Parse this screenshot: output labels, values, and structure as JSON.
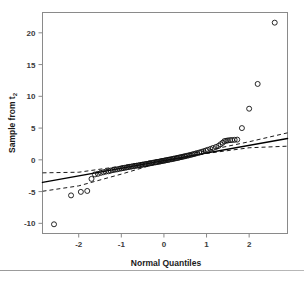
{
  "figure": {
    "name": "normal-qq-plot",
    "background_color": "#ffffff",
    "frame_color": "#8a8a8a",
    "point_color": "#111111",
    "line_color": "#000000",
    "band_color": "#1a1a1a"
  },
  "chart_data": {
    "type": "scatter",
    "title": "",
    "xlabel": "Normal Quantiles",
    "ylabel": "Sample from t",
    "ylabel_subscript": "2",
    "xlim": [
      -2.85,
      2.9
    ],
    "ylim": [
      -11.6,
      23.2
    ],
    "xticks": [
      -2,
      -1,
      0,
      1,
      2
    ],
    "xticklabels": [
      "-2",
      "-1",
      "0",
      "1",
      "2"
    ],
    "yticks": [
      -10,
      -5,
      0,
      5,
      10,
      15,
      20
    ],
    "yticklabels": [
      "-10",
      "-5",
      "0",
      "5",
      "10",
      "15",
      "20"
    ],
    "grid": false,
    "legend": null,
    "fit_line": {
      "label": "least-squares reference line",
      "x": [
        -2.85,
        2.9
      ],
      "y": [
        -3.55,
        3.35
      ]
    },
    "confidence_band_upper": {
      "label": "upper confidence band",
      "x": [
        -2.85,
        -2.0,
        -1.0,
        0.0,
        1.0,
        2.0,
        2.9
      ],
      "y": [
        -2.05,
        -1.95,
        -1.0,
        0.2,
        1.45,
        2.85,
        4.25
      ]
    },
    "confidence_band_lower": {
      "label": "lower confidence band",
      "x": [
        -2.85,
        -2.0,
        -1.0,
        0.0,
        1.0,
        2.0,
        2.9
      ],
      "y": [
        -4.95,
        -4.1,
        -2.25,
        -0.25,
        1.0,
        1.9,
        2.15
      ]
    },
    "series": [
      {
        "name": "sample quantiles",
        "marker": "open-circle",
        "points": [
          [
            -2.58,
            -10.15
          ],
          [
            -2.18,
            -5.6
          ],
          [
            -1.95,
            -5.05
          ],
          [
            -1.8,
            -4.9
          ],
          [
            -1.7,
            -3.0
          ],
          [
            -1.62,
            -2.3
          ],
          [
            -1.55,
            -2.2
          ],
          [
            -1.48,
            -2.05
          ],
          [
            -1.42,
            -1.95
          ],
          [
            -1.36,
            -1.85
          ],
          [
            -1.3,
            -1.8
          ],
          [
            -1.25,
            -1.7
          ],
          [
            -1.2,
            -1.62
          ],
          [
            -1.15,
            -1.55
          ],
          [
            -1.1,
            -1.5
          ],
          [
            -1.05,
            -1.42
          ],
          [
            -1.0,
            -1.36
          ],
          [
            -0.96,
            -1.3
          ],
          [
            -0.92,
            -1.25
          ],
          [
            -0.88,
            -1.2
          ],
          [
            -0.84,
            -1.14
          ],
          [
            -0.8,
            -1.1
          ],
          [
            -0.76,
            -1.05
          ],
          [
            -0.72,
            -1.0
          ],
          [
            -0.68,
            -0.96
          ],
          [
            -0.64,
            -0.92
          ],
          [
            -0.6,
            -0.88
          ],
          [
            -0.57,
            -0.84
          ],
          [
            -0.53,
            -0.8
          ],
          [
            -0.5,
            -0.76
          ],
          [
            -0.46,
            -0.72
          ],
          [
            -0.43,
            -0.68
          ],
          [
            -0.4,
            -0.64
          ],
          [
            -0.36,
            -0.6
          ],
          [
            -0.33,
            -0.56
          ],
          [
            -0.3,
            -0.52
          ],
          [
            -0.27,
            -0.48
          ],
          [
            -0.24,
            -0.44
          ],
          [
            -0.2,
            -0.4
          ],
          [
            -0.17,
            -0.36
          ],
          [
            -0.14,
            -0.32
          ],
          [
            -0.11,
            -0.28
          ],
          [
            -0.08,
            -0.24
          ],
          [
            -0.05,
            -0.2
          ],
          [
            -0.02,
            -0.16
          ],
          [
            0.01,
            -0.12
          ],
          [
            0.04,
            -0.08
          ],
          [
            0.07,
            -0.04
          ],
          [
            0.1,
            0.0
          ],
          [
            0.13,
            0.04
          ],
          [
            0.17,
            0.09
          ],
          [
            0.2,
            0.13
          ],
          [
            0.23,
            0.18
          ],
          [
            0.26,
            0.22
          ],
          [
            0.3,
            0.27
          ],
          [
            0.33,
            0.32
          ],
          [
            0.36,
            0.37
          ],
          [
            0.4,
            0.42
          ],
          [
            0.43,
            0.47
          ],
          [
            0.47,
            0.53
          ],
          [
            0.5,
            0.58
          ],
          [
            0.54,
            0.64
          ],
          [
            0.58,
            0.7
          ],
          [
            0.62,
            0.77
          ],
          [
            0.66,
            0.84
          ],
          [
            0.7,
            0.91
          ],
          [
            0.74,
            0.98
          ],
          [
            0.78,
            1.06
          ],
          [
            0.83,
            1.15
          ],
          [
            0.88,
            1.25
          ],
          [
            0.93,
            1.35
          ],
          [
            0.98,
            1.46
          ],
          [
            1.03,
            1.58
          ],
          [
            1.09,
            1.72
          ],
          [
            1.15,
            1.86
          ],
          [
            1.22,
            2.02
          ],
          [
            1.28,
            2.2
          ],
          [
            1.33,
            2.45
          ],
          [
            1.38,
            2.7
          ],
          [
            1.42,
            2.95
          ],
          [
            1.46,
            3.0
          ],
          [
            1.5,
            3.05
          ],
          [
            1.55,
            3.1
          ],
          [
            1.6,
            3.12
          ],
          [
            1.66,
            3.15
          ],
          [
            1.72,
            3.18
          ],
          [
            1.83,
            5.0
          ],
          [
            2.0,
            8.05
          ],
          [
            2.2,
            11.95
          ],
          [
            2.6,
            21.6
          ]
        ]
      }
    ]
  }
}
